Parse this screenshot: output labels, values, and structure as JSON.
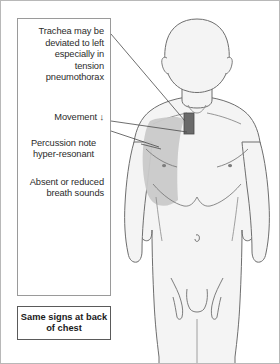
{
  "figure": {
    "type": "medical-illustration",
    "colors": {
      "body_fill": "#f4f4f4",
      "body_outline": "#6e6e6e",
      "lung_shade": "#c9c9c9",
      "trachea_marker": "#6a6a6a",
      "leader_line": "#4a4a4a",
      "panel_border": "#9a9a9a",
      "callout_border": "#5a5a5a",
      "frame_border": "#b8b8b8",
      "text": "#2b2b2b"
    },
    "markers": {
      "trachea_marker_label": "trachea-deviation-marker",
      "lung_shade_label": "hyper-resonant-lung-field",
      "side": "patient right / viewer left"
    }
  },
  "annotations": {
    "trachea": {
      "id": "trachea-note",
      "lines": [
        "Trachea may",
        "be deviated",
        "to left",
        "especially in",
        "tension",
        "pneumothorax"
      ],
      "text": "Trachea may be deviated to left especially in tension pneumothorax",
      "align": "right",
      "has_leader_line": true
    },
    "movement": {
      "id": "movement-note",
      "label": "Movement",
      "symbol": "↓",
      "text": "Movement ↓",
      "align": "right",
      "has_leader_line": true
    },
    "percussion": {
      "id": "percussion-note",
      "lines": [
        "Percussion note",
        "hyper-resonant"
      ],
      "text": "Percussion note hyper-resonant",
      "align": "center",
      "has_leader_line": false
    },
    "breath_sounds": {
      "id": "breath-sounds-note",
      "lines": [
        "Absent or",
        "reduced breath",
        "sounds"
      ],
      "text": "Absent or reduced breath sounds",
      "align": "right",
      "has_leader_line": false
    }
  },
  "callout": {
    "id": "back-of-chest-callout",
    "lines": [
      "Same signs at",
      "back of chest"
    ],
    "text": "Same signs at back of chest",
    "bold": true
  }
}
